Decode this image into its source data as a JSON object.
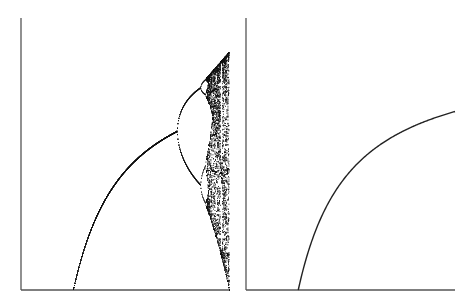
{
  "chart_data": [
    {
      "type": "scatter",
      "title": "",
      "xlabel": "",
      "ylabel": "",
      "description": "Bifurcation diagram of the logistic map x -> r x (1 - x): stable fixed point branch from r=1, period-doubling at r=3 and r~3.449, chaos beyond r~3.57 up to r=4 with a period-3 window near r~3.83",
      "xlim": [
        0,
        4
      ],
      "ylim": [
        0,
        1
      ],
      "grid": false,
      "axes": {
        "left": true,
        "bottom": true
      },
      "key_points": [
        {
          "label": "transcritical",
          "r": 1.0,
          "x": 0.0
        },
        {
          "label": "first-bifurcation",
          "r": 3.0,
          "x": 0.667
        },
        {
          "label": "second-bifurcation",
          "r": 3.449,
          "x_upper": 0.85,
          "x_lower": 0.44
        },
        {
          "label": "chaos-onset",
          "r": 3.57
        },
        {
          "label": "period-3-window",
          "r": 3.83
        },
        {
          "label": "end",
          "r": 4.0,
          "x_max": 1.0,
          "x_min": 0.0
        }
      ],
      "color": "#111111"
    },
    {
      "type": "line",
      "title": "",
      "xlabel": "",
      "ylabel": "",
      "description": "Fixed point x* = 1 - 1/r of the logistic map for r in [1, 4]",
      "xlim": [
        0,
        4
      ],
      "ylim": [
        0,
        1
      ],
      "grid": false,
      "axes": {
        "left": true,
        "bottom": true
      },
      "x": [
        1.0,
        1.5,
        2.0,
        2.5,
        3.0,
        3.5,
        4.0
      ],
      "values": [
        0.0,
        0.333,
        0.5,
        0.6,
        0.667,
        0.714,
        0.75
      ],
      "color": "#222222"
    }
  ],
  "panels": {
    "left": {
      "name": "bifurcation-diagram"
    },
    "right": {
      "name": "fixed-point-curve"
    }
  }
}
